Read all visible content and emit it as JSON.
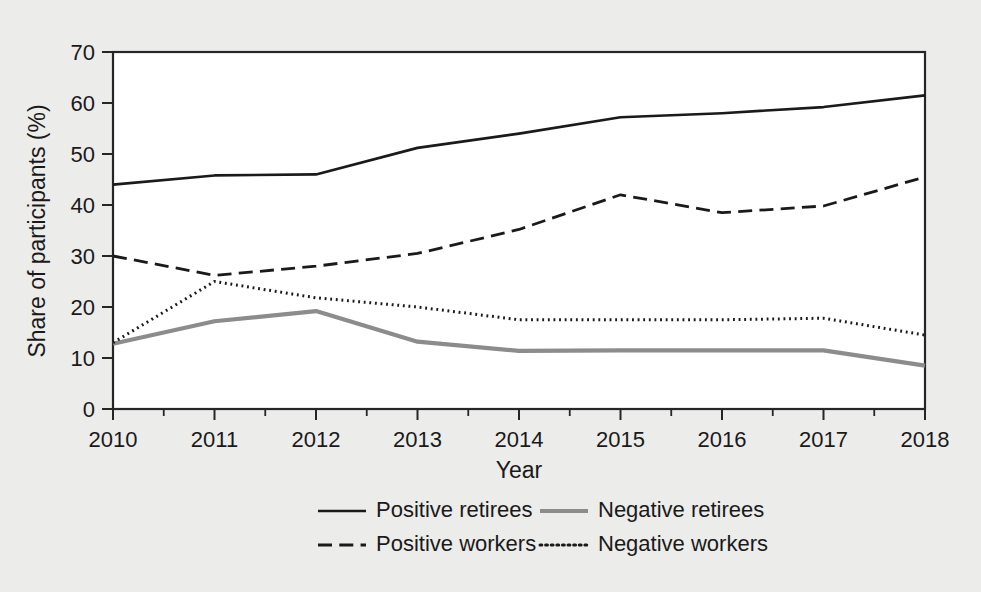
{
  "chart_data": {
    "type": "line",
    "title": "",
    "xlabel": "Year",
    "ylabel": "Share of participants (%)",
    "x": [
      2010,
      2011,
      2012,
      2013,
      2014,
      2015,
      2016,
      2017,
      2018
    ],
    "xticklabels": [
      "2010",
      "2011",
      "2012",
      "2013",
      "2014",
      "2015",
      "2016",
      "2017",
      "2018"
    ],
    "yticklabels": [
      "0",
      "10",
      "20",
      "30",
      "40",
      "50",
      "60",
      "70"
    ],
    "yticks": [
      0,
      10,
      20,
      30,
      40,
      50,
      60,
      70
    ],
    "xlim": [
      2010,
      2018
    ],
    "ylim": [
      0,
      70
    ],
    "grid": false,
    "legend_position": "bottom",
    "minor_xticks": true,
    "series": [
      {
        "name": "Positive retirees",
        "style": "solid",
        "color": "#1a1a1a",
        "width": 2.6,
        "values": [
          44.0,
          45.8,
          46.0,
          51.2,
          54.0,
          57.2,
          58.0,
          59.2,
          61.5
        ]
      },
      {
        "name": "Negative retirees",
        "style": "solid",
        "color": "#8c8c8c",
        "width": 4.2,
        "values": [
          12.8,
          17.2,
          19.2,
          13.2,
          11.4,
          11.5,
          11.5,
          11.5,
          8.5
        ]
      },
      {
        "name": "Positive workers",
        "style": "dashed",
        "color": "#1a1a1a",
        "width": 2.8,
        "values": [
          30.0,
          26.2,
          28.0,
          30.5,
          35.2,
          42.0,
          38.5,
          39.8,
          45.5
        ]
      },
      {
        "name": "Negative workers",
        "style": "dotted",
        "color": "#1a1a1a",
        "width": 3.0,
        "values": [
          13.0,
          25.0,
          21.8,
          20.0,
          17.5,
          17.5,
          17.5,
          17.8,
          14.5
        ]
      }
    ]
  },
  "legend": {
    "entries": [
      {
        "label": "Positive retirees",
        "style": "solid",
        "color": "#1a1a1a",
        "width": 2.6
      },
      {
        "label": "Negative retirees",
        "style": "solid",
        "color": "#8c8c8c",
        "width": 4.2
      },
      {
        "label": "Positive workers",
        "style": "dashed",
        "color": "#1a1a1a",
        "width": 2.8
      },
      {
        "label": "Negative workers",
        "style": "dotted",
        "color": "#1a1a1a",
        "width": 3.0
      }
    ]
  },
  "colors": {
    "background": "#ececeb",
    "plot_background": "#ffffff",
    "axis": "#262626",
    "text": "#1a1a1a",
    "accent_gray": "#8c8c8c"
  }
}
